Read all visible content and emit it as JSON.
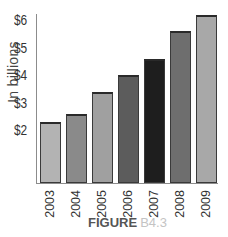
{
  "chart_data": {
    "type": "bar",
    "title": "",
    "xlabel": "",
    "ylabel": "In billions",
    "categories": [
      "2003",
      "2004",
      "2005",
      "2006",
      "2007",
      "2008",
      "2009"
    ],
    "values": [
      2.3,
      2.6,
      3.4,
      4.0,
      4.6,
      5.6,
      6.2
    ],
    "bar_colors": [
      "#b3b3b3",
      "#8a8a8a",
      "#a0a0a0",
      "#5c5c5c",
      "#1e1e1e",
      "#6e6e6e",
      "#a8a8a8"
    ],
    "y_ticks": [
      "$2",
      "$3",
      "$4",
      "$5",
      "$6"
    ],
    "ylim": [
      0.3,
      6.5
    ],
    "grid": false,
    "legend": null
  },
  "caption": {
    "figure_label": "FIGURE",
    "figure_number": "B4.3"
  }
}
